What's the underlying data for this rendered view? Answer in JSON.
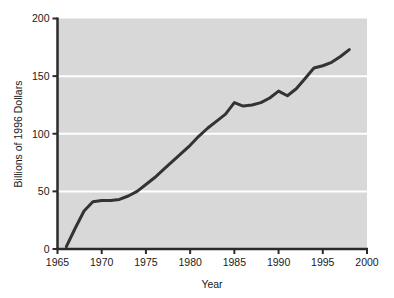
{
  "chart_data": {
    "type": "line",
    "title": "",
    "subtitle": "",
    "xlabel": "Year",
    "ylabel": "Billions of 1996 Dollars",
    "xlim": [
      1965,
      2000
    ],
    "ylim": [
      0,
      200
    ],
    "xticks": [
      1965,
      1970,
      1975,
      1980,
      1985,
      1990,
      1995,
      2000
    ],
    "xtick_labels": [
      "1965",
      "1970",
      "1975",
      "1980",
      "1985",
      "1990",
      "1995",
      "2000"
    ],
    "yticks": [
      0,
      50,
      100,
      150,
      200
    ],
    "ytick_labels": [
      "0",
      "50",
      "100",
      "150",
      "200"
    ],
    "grid": "horizontal-only",
    "gridlines_y": [
      50,
      100,
      150
    ],
    "gridline_color": "#ffffff",
    "plot_background_color": "#d8d8d8",
    "figure_background_color": "#ffffff",
    "axis_line_color": "#2b2b2b",
    "series": [
      {
        "name": "Spending",
        "line_color": "#333333",
        "line_width": 3,
        "x": [
          1966,
          1967,
          1968,
          1969,
          1970,
          1971,
          1972,
          1973,
          1974,
          1975,
          1976,
          1977,
          1978,
          1979,
          1980,
          1981,
          1982,
          1983,
          1984,
          1985,
          1986,
          1987,
          1988,
          1989,
          1990,
          1991,
          1992,
          1993,
          1994,
          1995,
          1996,
          1997,
          1998
        ],
        "values": [
          2,
          18,
          33,
          41,
          42,
          42,
          43,
          46,
          50,
          56,
          62,
          69,
          76,
          83,
          90,
          98,
          105,
          111,
          117,
          127,
          124,
          125,
          127,
          131,
          137,
          133,
          139,
          148,
          157,
          159,
          162,
          167,
          173
        ]
      }
    ],
    "annotations": []
  }
}
